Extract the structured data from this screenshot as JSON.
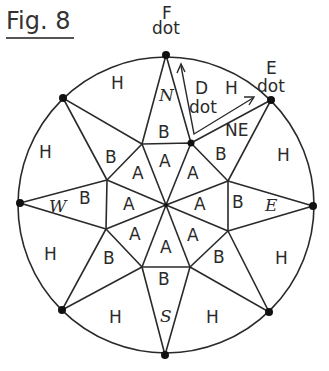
{
  "figure": {
    "title": "Fig. 8",
    "center": [
      166,
      205
    ],
    "radius": 148,
    "outer_points": [
      [
        166,
        55
      ],
      [
        271,
        100
      ],
      [
        313,
        206
      ],
      [
        269,
        312
      ],
      [
        165,
        355
      ],
      [
        62,
        310
      ],
      [
        20,
        203
      ],
      [
        63,
        98
      ]
    ],
    "octagon": [
      [
        142,
        144
      ],
      [
        191,
        143
      ],
      [
        228,
        181
      ],
      [
        228,
        231
      ],
      [
        190,
        267
      ],
      [
        142,
        267
      ],
      [
        106,
        229
      ],
      [
        107,
        180
      ]
    ],
    "direction_labels": {
      "N": "N",
      "NE": "NE",
      "E": "E",
      "S": "S",
      "W": "W"
    },
    "region_labels": {
      "A": "A",
      "B": "B",
      "H": "H",
      "D": "D"
    },
    "annotations": {
      "F_letter": "F",
      "F_dot": "dot",
      "E_letter": "E",
      "E_dot": "dot",
      "D_letter": "D",
      "D_dot": "dot"
    }
  }
}
